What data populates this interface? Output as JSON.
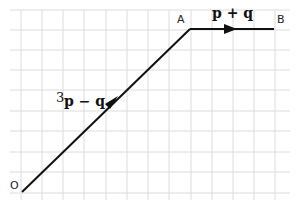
{
  "diagram": {
    "type": "vector-diagram",
    "grid": {
      "x_lines": [
        21,
        42,
        63,
        84,
        106,
        127,
        148,
        169,
        191,
        212,
        233,
        254,
        275
      ],
      "y_lines": [
        10,
        30,
        50,
        70,
        90,
        111,
        131,
        152,
        172,
        193
      ],
      "color": "#dcdcdc"
    },
    "points": [
      {
        "label": "O",
        "x": 22,
        "y": 192
      },
      {
        "label": "A",
        "x": 190,
        "y": 29
      },
      {
        "label": "B",
        "x": 274,
        "y": 29
      }
    ],
    "vectors": [
      {
        "from": "O",
        "to": "A",
        "coef": "3",
        "label": "p − q"
      },
      {
        "from": "A",
        "to": "B",
        "coef": "",
        "label": "p + q"
      }
    ],
    "line_color": "#111111"
  }
}
